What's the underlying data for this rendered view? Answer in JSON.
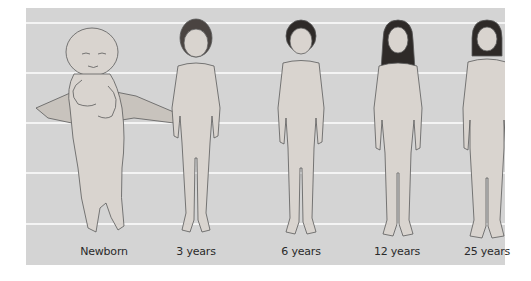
{
  "diagram": {
    "background_color": "#d4d4d4",
    "gridline_color": "#f4f4f4",
    "gridline_y_offsets": [
      14,
      64,
      114,
      164,
      215
    ],
    "figures": [
      {
        "label": "Newborn",
        "center_x": 78
      },
      {
        "label": "3 years",
        "center_x": 170
      },
      {
        "label": "6 years",
        "center_x": 275
      },
      {
        "label": "12 years",
        "center_x": 371
      },
      {
        "label": "25 years",
        "center_x": 461
      }
    ]
  }
}
